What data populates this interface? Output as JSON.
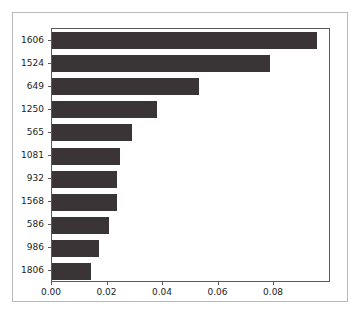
{
  "chart_data": {
    "type": "bar",
    "orientation": "horizontal",
    "title": "",
    "xlabel": "",
    "ylabel": "",
    "categories": [
      "1606",
      "1524",
      "649",
      "1250",
      "565",
      "1081",
      "932",
      "1568",
      "586",
      "986",
      "1806"
    ],
    "values": [
      0.0955,
      0.0785,
      0.0529,
      0.0378,
      0.0288,
      0.0245,
      0.0234,
      0.0234,
      0.0205,
      0.0169,
      0.014
    ],
    "xlim": [
      0.0,
      0.1005
    ],
    "xticks": [
      0.0,
      0.02,
      0.04,
      0.06,
      0.08
    ],
    "xtick_labels": [
      "0.00",
      "0.02",
      "0.04",
      "0.06",
      "0.08"
    ],
    "grid": false,
    "legend": false,
    "bar_color": "#3b3436",
    "axis_color": "#5a5a5a",
    "frame_color": "#b9b9b9",
    "background": "#ffffff"
  }
}
